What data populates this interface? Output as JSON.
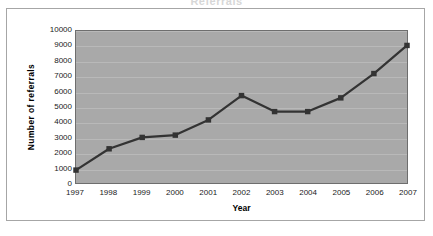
{
  "clipped_title": "Referrals",
  "axis": {
    "y_title": "Number of referrals",
    "x_title": "Year"
  },
  "chart_data": {
    "type": "line",
    "title": "",
    "xlabel": "Year",
    "ylabel": "Number of referrals",
    "categories": [
      "1997",
      "1998",
      "1999",
      "2000",
      "2001",
      "2002",
      "2003",
      "2004",
      "2005",
      "2006",
      "2007"
    ],
    "values": [
      850,
      2250,
      3000,
      3150,
      4150,
      5750,
      4700,
      4700,
      5600,
      7200,
      9050
    ],
    "series": [
      {
        "name": "Number of referrals",
        "values": [
          850,
          2250,
          3000,
          3150,
          4150,
          5750,
          4700,
          4700,
          5600,
          7200,
          9050
        ]
      }
    ],
    "ylim": [
      0,
      10000
    ],
    "ytick_step": 1000,
    "yticks": [
      "10000",
      "9000",
      "8000",
      "7000",
      "6000",
      "5000",
      "4000",
      "3000",
      "2000",
      "1000",
      "0"
    ],
    "grid": true,
    "legend": "none",
    "marker": "square",
    "colors": {
      "line": "#333333",
      "marker": "#333333",
      "plot_background": "#a9a9a9",
      "gridline": "#b9b9b9",
      "frame": "#a6a6a6",
      "text": "#1a1a1a"
    }
  }
}
